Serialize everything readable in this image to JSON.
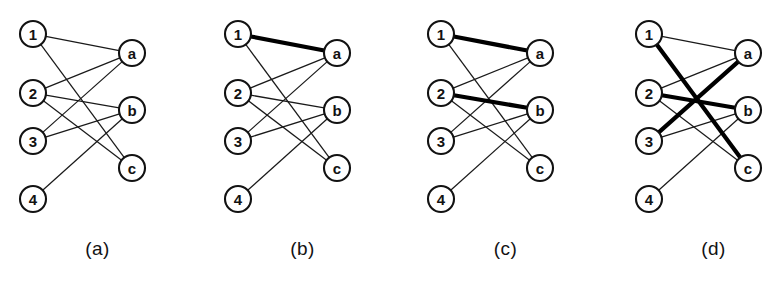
{
  "figure": {
    "background_color": "#ffffff",
    "ink_color": "#121212",
    "panel_count": 4,
    "panel_width": 195,
    "panel_height": 298
  },
  "graph": {
    "left_nodes": [
      {
        "id": "1",
        "label": "1",
        "x": 33,
        "y": 34
      },
      {
        "id": "2",
        "label": "2",
        "x": 33,
        "y": 93
      },
      {
        "id": "3",
        "label": "3",
        "x": 33,
        "y": 141
      },
      {
        "id": "4",
        "label": "4",
        "x": 33,
        "y": 199
      }
    ],
    "right_nodes": [
      {
        "id": "a",
        "label": "a",
        "x": 132,
        "y": 53
      },
      {
        "id": "b",
        "label": "b",
        "x": 132,
        "y": 110
      },
      {
        "id": "c",
        "label": "c",
        "x": 132,
        "y": 168
      }
    ],
    "node_radius": 13,
    "edges": [
      {
        "from": "1",
        "to": "a"
      },
      {
        "from": "1",
        "to": "c"
      },
      {
        "from": "2",
        "to": "a"
      },
      {
        "from": "2",
        "to": "b"
      },
      {
        "from": "2",
        "to": "c"
      },
      {
        "from": "3",
        "to": "a"
      },
      {
        "from": "3",
        "to": "b"
      },
      {
        "from": "4",
        "to": "b"
      }
    ]
  },
  "panels": [
    {
      "key": "a",
      "caption": "(a)",
      "offset_x": 0,
      "matching": []
    },
    {
      "key": "b",
      "caption": "(b)",
      "offset_x": 205,
      "matching": [
        {
          "from": "1",
          "to": "a"
        }
      ]
    },
    {
      "key": "c",
      "caption": "(c)",
      "offset_x": 408,
      "matching": [
        {
          "from": "1",
          "to": "a"
        },
        {
          "from": "2",
          "to": "b"
        }
      ]
    },
    {
      "key": "d",
      "caption": "(d)",
      "offset_x": 616,
      "matching": [
        {
          "from": "1",
          "to": "c"
        },
        {
          "from": "2",
          "to": "b"
        },
        {
          "from": "3",
          "to": "a"
        }
      ]
    }
  ]
}
